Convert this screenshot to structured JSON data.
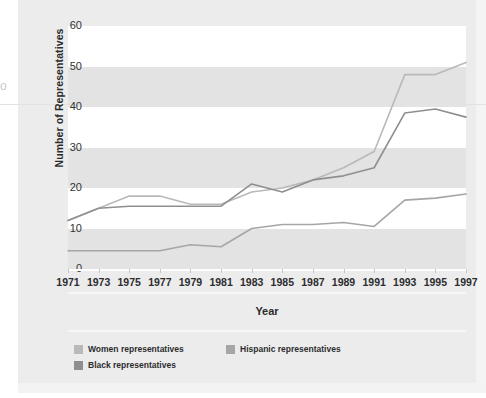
{
  "chart_data": {
    "type": "line",
    "title": "",
    "xlabel": "Year",
    "ylabel": "Number of Representatives",
    "x": [
      1971,
      1973,
      1975,
      1977,
      1979,
      1981,
      1983,
      1985,
      1987,
      1989,
      1991,
      1993,
      1995,
      1997
    ],
    "categories": [
      "1971",
      "1973",
      "1975",
      "1977",
      "1979",
      "1981",
      "1983",
      "1985",
      "1987",
      "1989",
      "1991",
      "1993",
      "1995",
      "1997"
    ],
    "xlim": [
      1971,
      1997
    ],
    "ylim": [
      0,
      60
    ],
    "yticks": [
      0,
      10,
      20,
      30,
      40,
      50,
      60
    ],
    "ytick_labels": [
      "0",
      "10",
      "20",
      "30",
      "40",
      "50",
      "60"
    ],
    "grid": "horizontal-banding",
    "legend_position": "below-axes-left",
    "series": [
      {
        "name": "Women representatives",
        "color": "#b9b9ba",
        "values": [
          12,
          15,
          18,
          18,
          16,
          16,
          19,
          20,
          22,
          25,
          29,
          48,
          48,
          51
        ]
      },
      {
        "name": "Black representatives",
        "color": "#8f8f91",
        "values": [
          12,
          15,
          15.5,
          15.5,
          15.5,
          15.5,
          21,
          19,
          22,
          23,
          25,
          38.5,
          39.5,
          37.5
        ]
      },
      {
        "name": "Hispanic representatives",
        "color": "#a6a6a8",
        "values": [
          4.5,
          4.5,
          4.5,
          4.5,
          6,
          5.5,
          10,
          11,
          11,
          11.5,
          10.5,
          17,
          17.5,
          18.5
        ]
      }
    ]
  },
  "legend": {
    "items": [
      {
        "label": "Women representatives",
        "color": "#b9b9ba"
      },
      {
        "label": "Hispanic representatives",
        "color": "#a6a6a8"
      },
      {
        "label": "Black representatives",
        "color": "#8f8f91"
      }
    ]
  },
  "artifact": {
    "glyph": "o"
  }
}
